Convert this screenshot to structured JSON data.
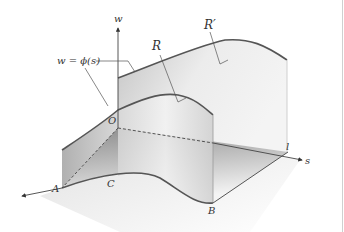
{
  "diagram": {
    "type": "3d-surface-schematic",
    "axes": {
      "w": "w",
      "s": "s"
    },
    "points": {
      "origin": "O",
      "A": "A",
      "B": "B",
      "l": "l"
    },
    "curve_label": "C",
    "regions": {
      "front": "R",
      "back": "R′"
    },
    "equation_label": "w = ϕ(s)",
    "colors": {
      "curve": "#555555",
      "axis": "#444444",
      "wall_dark": "#8c8c8c",
      "wall_light": "#e6e6e6",
      "floor_dark": "#8a8a8a",
      "floor_light": "#f0f0f0"
    }
  }
}
